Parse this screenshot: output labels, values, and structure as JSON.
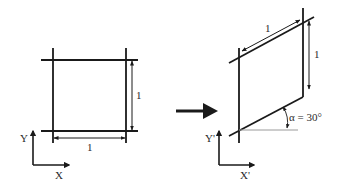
{
  "diagram": {
    "colors": {
      "line": "#1a1a1a",
      "guide": "#9a9a9a",
      "background": "#ffffff"
    },
    "before": {
      "side_horizontal_label": "1",
      "side_vertical_label": "1",
      "axis_x_label": "X",
      "axis_y_label": "Y"
    },
    "transition_arrow": "right-arrow",
    "after": {
      "side_slanted_label": "1",
      "side_vertical_label": "1",
      "angle_label": "α = 30°",
      "axis_x_label": "X'",
      "axis_y_label": "Y'"
    }
  }
}
